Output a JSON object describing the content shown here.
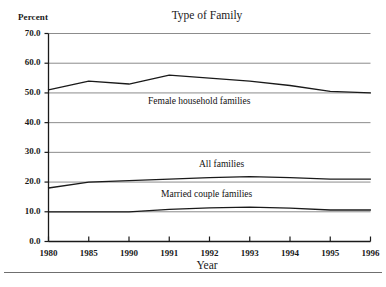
{
  "chart_data": {
    "type": "line",
    "title": "Type of Family",
    "xlabel": "Year",
    "ylabel": "Percent",
    "ylim": [
      0.0,
      70.0
    ],
    "grid": true,
    "legend_position": "inline-annotations",
    "categories": [
      "1980",
      "1985",
      "1990",
      "1991",
      "1992",
      "1993",
      "1994",
      "1995",
      "1996"
    ],
    "ytick_labels": [
      "70.0",
      "60.0",
      "50.0",
      "40.0",
      "30.0",
      "20.0",
      "10.0",
      "0.0"
    ],
    "ytick_values": [
      70.0,
      60.0,
      50.0,
      40.0,
      30.0,
      20.0,
      10.0,
      0.0
    ],
    "series": [
      {
        "name": "Female household families",
        "values": [
          51.0,
          54.0,
          53.0,
          56.0,
          55.0,
          54.0,
          52.5,
          50.5,
          50.0
        ]
      },
      {
        "name": "All families",
        "values": [
          18.0,
          20.0,
          20.5,
          21.0,
          21.5,
          21.8,
          21.5,
          21.0,
          21.0
        ]
      },
      {
        "name": "Married couple families",
        "values": [
          10.0,
          10.0,
          10.0,
          10.8,
          11.3,
          11.6,
          11.2,
          10.6,
          10.6
        ]
      }
    ],
    "annotations": [
      {
        "text": "Female household families",
        "series": "Female household families"
      },
      {
        "text": "All families",
        "series": "All families"
      },
      {
        "text": "Married couple families",
        "series": "Married couple families"
      }
    ],
    "colors": {
      "line": "#1a1a1a",
      "grid": "#8c8c8c",
      "axis": "#1a1a1a",
      "background": "#ffffff"
    }
  }
}
